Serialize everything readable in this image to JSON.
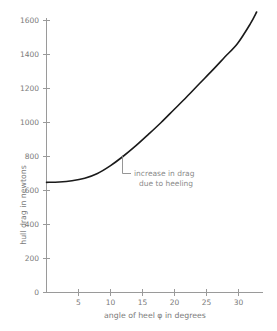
{
  "chart_data": {
    "type": "line",
    "title": "",
    "xlabel": "angle of heel φ in degrees",
    "ylabel": "hull drag in newtons",
    "xlim": [
      0,
      34
    ],
    "ylim": [
      0,
      1700
    ],
    "grid": false,
    "legend": "none",
    "xticks": [
      0,
      5,
      10,
      15,
      20,
      25,
      30
    ],
    "xticklabels": [
      "",
      "5",
      "10",
      "15",
      "20",
      "25",
      "30"
    ],
    "yticks": [
      0,
      200,
      400,
      600,
      800,
      1000,
      1200,
      1400,
      1600
    ],
    "yticklabels": [
      "0",
      "200",
      "400",
      "600",
      "800",
      "1000",
      "1200",
      "1400",
      "1600"
    ],
    "series": [
      {
        "name": "hull drag",
        "x": [
          0,
          2,
          4,
          6,
          8,
          10,
          12,
          14,
          16,
          18,
          20,
          22,
          24,
          26,
          28,
          30,
          32,
          33
        ],
        "values": [
          648,
          650,
          657,
          672,
          700,
          745,
          800,
          862,
          930,
          1000,
          1075,
          1150,
          1228,
          1305,
          1385,
          1465,
          1580,
          1650
        ]
      }
    ],
    "annotations": [
      {
        "text_line1": "increase in drag",
        "text_line2": "due to heeling",
        "point_x": 11.9,
        "point_y": 800
      }
    ]
  },
  "axis": {
    "x_tick_0": "",
    "x_tick_5": "5",
    "x_tick_10": "10",
    "x_tick_15": "15",
    "x_tick_20": "20",
    "x_tick_25": "25",
    "x_tick_30": "30",
    "y_tick_0": "0",
    "y_tick_200": "200",
    "y_tick_400": "400",
    "y_tick_600": "600",
    "y_tick_800": "800",
    "y_tick_1000": "1000",
    "y_tick_1200": "1200",
    "y_tick_1400": "1400",
    "y_tick_1600": "1600"
  },
  "colors": {
    "background": "#ffffff",
    "axis": "#9a9a9a",
    "text": "#7a7a7a",
    "curve": "#1a1a1a",
    "annotation": "#8a8a8a"
  }
}
